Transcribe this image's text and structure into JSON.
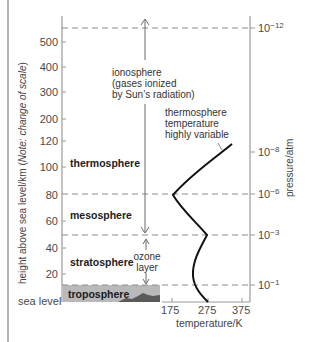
{
  "diagram": {
    "left_axis": {
      "title": "height above sea level/km (Note: change of scale)",
      "title_plain": "height above sea level/km (",
      "title_italic": "Note: change of scale",
      "title_close": ")",
      "ticks": [
        "500",
        "400",
        "300",
        "200",
        "120",
        "100",
        "80",
        "60",
        "40",
        "20"
      ],
      "baseline_label": "sea level"
    },
    "right_axis": {
      "title": "pressure/atm",
      "ticks": [
        {
          "base": "10",
          "exp": "−12"
        },
        {
          "base": "10",
          "exp": "−8"
        },
        {
          "base": "10",
          "exp": "−6"
        },
        {
          "base": "10",
          "exp": "−3"
        },
        {
          "base": "10",
          "exp": "−1"
        }
      ]
    },
    "bottom_axis": {
      "title": "temperature/K",
      "ticks": [
        "175",
        "275",
        "375"
      ]
    },
    "layers": {
      "thermosphere": "thermosphere",
      "mesosphere": "mesosphere",
      "stratosphere": "stratosphere",
      "troposphere": "troposphere"
    },
    "annotations": {
      "ionosphere_line1": "ionosphere",
      "ionosphere_line2": "(gases ionized",
      "ionosphere_line3": "by Sun’s radiation)",
      "ozone_line1": "ozone",
      "ozone_line2": "layer",
      "thermo_temp_line1": "thermosphere",
      "thermo_temp_line2": "temperature",
      "thermo_temp_line3": "highly variable"
    },
    "colors": {
      "troposphere_fill": "#b9b9b9",
      "mountains": "#5a5a5a",
      "curve": "#111111",
      "dashed": "#8a8a8a",
      "axis": "#9a9a9a"
    }
  }
}
